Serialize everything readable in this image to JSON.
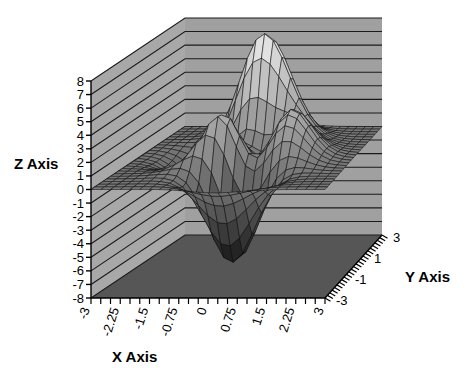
{
  "chart_data": {
    "type": "surface",
    "title": "",
    "xlabel": "X Axis",
    "ylabel": "Y Axis",
    "zlabel": "Z Axis",
    "xlim": [
      -3,
      3
    ],
    "ylim": [
      -3,
      3
    ],
    "zlim": [
      -8,
      8
    ],
    "xticks": [
      "-3",
      "-2.25",
      "-1.5",
      "-0.75",
      "0",
      "0.75",
      "1.5",
      "2.25",
      "3"
    ],
    "xtick_values": [
      -3,
      -2.25,
      -1.5,
      -0.75,
      0,
      0.75,
      1.5,
      2.25,
      3
    ],
    "yticks": [
      "3",
      "1",
      "-1",
      "-3"
    ],
    "ytick_values": [
      3,
      1,
      -1,
      -3
    ],
    "zticks": [
      "8",
      "7",
      "6",
      "5",
      "4",
      "3",
      "2",
      "1",
      "0",
      "-1",
      "-2",
      "-3",
      "-4",
      "-5",
      "-6",
      "-7",
      "-8"
    ],
    "ztick_values": [
      8,
      7,
      6,
      5,
      4,
      3,
      2,
      1,
      0,
      -1,
      -2,
      -3,
      -4,
      -5,
      -6,
      -7,
      -8
    ],
    "grid": true,
    "legend": false,
    "colormap": "grayscale",
    "x": [
      -3,
      -2.625,
      -2.25,
      -1.875,
      -1.5,
      -1.125,
      -0.75,
      -0.375,
      0,
      0.375,
      0.75,
      1.125,
      1.5,
      1.875,
      2.25,
      2.625,
      3
    ],
    "y": [
      -3,
      -2.625,
      -2.25,
      -1.875,
      -1.5,
      -1.125,
      -0.75,
      -0.375,
      0,
      0.375,
      0.75,
      1.125,
      1.5,
      1.875,
      2.25,
      2.625,
      3
    ],
    "z_description": "peaks(x,y) = 3*(1-x)^2*exp(-x^2-(y+1)^2) - 10*(x/5 - x^3 - y^5)*exp(-x^2-y^2) - (1/3)*exp(-(x+1)^2 - y^2)",
    "z_min": -6.55,
    "z_max": 8.08,
    "surface_features": [
      {
        "name": "tall-peak",
        "x": -0.01,
        "y": 1.58,
        "z": 8.08
      },
      {
        "name": "secondary-peak",
        "x": -0.46,
        "y": 0.63,
        "z": 3.78
      },
      {
        "name": "shoulder-peak",
        "x": 1.29,
        "y": 0.0,
        "z": 3.59
      },
      {
        "name": "deep-valley",
        "x": 0.23,
        "y": -1.63,
        "z": -6.55
      },
      {
        "name": "shallow-dip",
        "x": -1.35,
        "y": -0.2,
        "z": -0.44
      }
    ]
  },
  "colors": {
    "wall_left": "#a8a8a8",
    "wall_right": "#a0a0a0",
    "floor": "#565656",
    "grid_line": "#1a1a1a",
    "axis_line": "#000000",
    "mesh_line": "#111111",
    "background": "#ffffff",
    "surface_low": "#1c1c1c",
    "surface_high": "#f2f2f2"
  },
  "axis_titles": {
    "x": "X Axis",
    "y": "Y Axis",
    "z": "Z Axis"
  }
}
